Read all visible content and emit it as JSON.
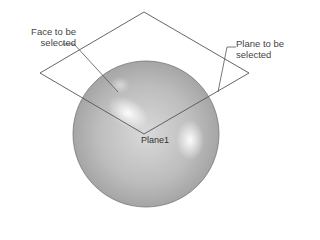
{
  "diagram": {
    "labels": {
      "face_line1": "Face to be",
      "face_line2": "selected",
      "plane_line1": "Plane to be",
      "plane_line2": "selected",
      "plane_name": "Plane1"
    },
    "colors": {
      "background": "#ffffff",
      "line": "#555555",
      "sphere_base": "#b8b8b8",
      "sphere_highlight": "#ffffff",
      "text": "#444444"
    },
    "shapes": {
      "plane_corners": [
        [
          144,
          12
        ],
        [
          249,
          73
        ],
        [
          144,
          134
        ],
        [
          40,
          73
        ]
      ],
      "sphere": {
        "cx": 145,
        "cy": 134,
        "r": 73
      }
    }
  }
}
